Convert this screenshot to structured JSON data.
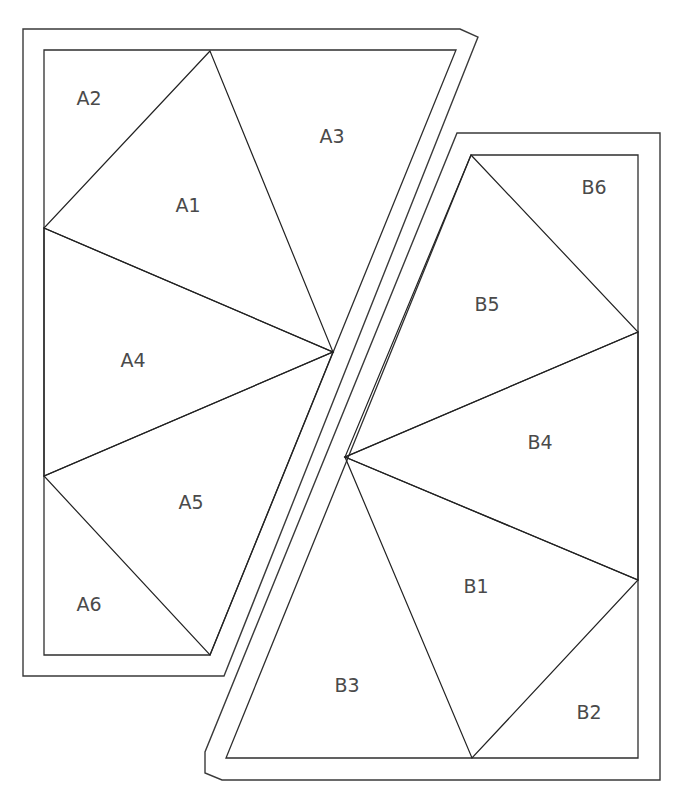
{
  "diagram": {
    "stroke_color": "#2e2e2e",
    "label_color": "#4a4a4a",
    "background_color": "#ffffff",
    "pieces": [
      {
        "id": "A",
        "name": "Piece A",
        "sections": [
          {
            "id": "A1",
            "label": "A1"
          },
          {
            "id": "A2",
            "label": "A2"
          },
          {
            "id": "A3",
            "label": "A3"
          },
          {
            "id": "A4",
            "label": "A4"
          },
          {
            "id": "A5",
            "label": "A5"
          },
          {
            "id": "A6",
            "label": "A6"
          }
        ]
      },
      {
        "id": "B",
        "name": "Piece B",
        "sections": [
          {
            "id": "B1",
            "label": "B1"
          },
          {
            "id": "B2",
            "label": "B2"
          },
          {
            "id": "B3",
            "label": "B3"
          },
          {
            "id": "B4",
            "label": "B4"
          },
          {
            "id": "B5",
            "label": "B5"
          },
          {
            "id": "B6",
            "label": "B6"
          }
        ]
      }
    ]
  }
}
